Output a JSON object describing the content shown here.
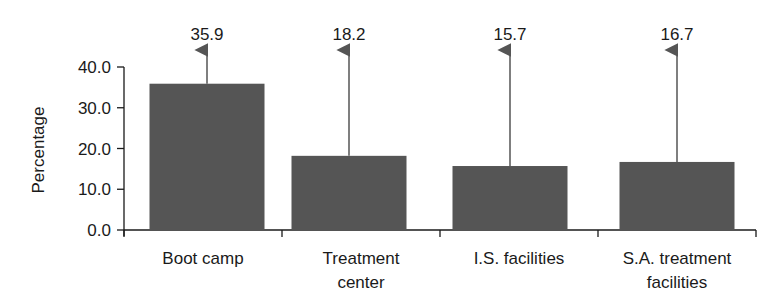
{
  "chart_data": {
    "type": "bar",
    "title": "",
    "xlabel": "",
    "ylabel": "Percentage",
    "ylim": [
      0,
      40
    ],
    "yticks": [
      "0.0",
      "10.0",
      "20.0",
      "30.0",
      "40.0"
    ],
    "grid": false,
    "legend": null,
    "categories": [
      [
        "Boot camp"
      ],
      [
        "Treatment",
        "center"
      ],
      [
        "I.S. facilities"
      ],
      [
        "S.A. treatment",
        "facilities"
      ]
    ],
    "values": [
      35.9,
      18.2,
      15.7,
      16.7
    ],
    "value_labels": [
      "35.9",
      "18.2",
      "15.7",
      "16.7"
    ],
    "annotations": "Upward arrows from each bar top to its value label",
    "colors": {
      "bar": "#555555",
      "axis": "#1a1a1a",
      "arrow": "#555555"
    }
  }
}
